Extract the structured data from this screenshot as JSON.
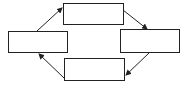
{
  "diagram": {
    "type": "cycle",
    "stroke_color": "#222222",
    "background": "#ffffff",
    "nodes": [
      {
        "id": "left",
        "label": "",
        "x": 8,
        "y": 31,
        "w": 60,
        "h": 22
      },
      {
        "id": "top",
        "label": "",
        "x": 63,
        "y": 3,
        "w": 61,
        "h": 22
      },
      {
        "id": "right",
        "label": "",
        "x": 120,
        "y": 29,
        "w": 60,
        "h": 24
      },
      {
        "id": "bottom",
        "label": "",
        "x": 64,
        "y": 58,
        "w": 61,
        "h": 23
      }
    ],
    "edges": [
      {
        "from": "left",
        "to": "top"
      },
      {
        "from": "top",
        "to": "right"
      },
      {
        "from": "right",
        "to": "bottom"
      },
      {
        "from": "bottom",
        "to": "left"
      }
    ]
  }
}
